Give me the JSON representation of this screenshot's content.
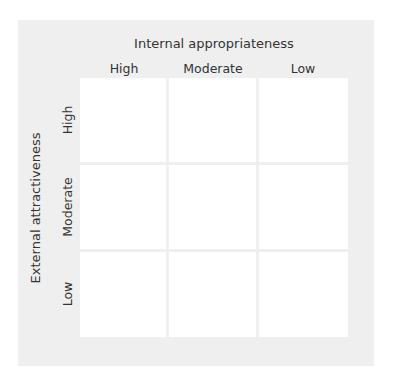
{
  "matrix": {
    "x_axis_title": "Internal appropriateness",
    "y_axis_title": "External attractiveness",
    "columns": [
      "High",
      "Moderate",
      "Low"
    ],
    "rows": [
      "High",
      "Moderate",
      "Low"
    ],
    "cells": [
      [
        "",
        "",
        ""
      ],
      [
        "",
        "",
        ""
      ],
      [
        "",
        "",
        ""
      ]
    ],
    "colors": {
      "panel": "#efefef",
      "cell": "#ffffff",
      "text": "#333333"
    }
  }
}
